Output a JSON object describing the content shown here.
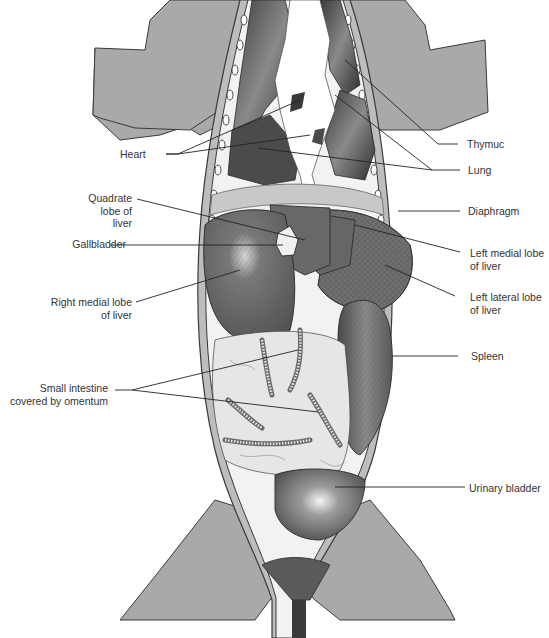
{
  "figure": {
    "colors": {
      "background": "#ffffff",
      "body_silhouette": "#a9a9a9",
      "outline": "#3a3a3a",
      "organ_dark": "#5a5a5a",
      "organ_mid": "#7d7d7d",
      "intestine_light": "#e6e6e6",
      "label_text": "#333333",
      "leader_line": "#222222"
    }
  },
  "labels": {
    "heart": "Heart",
    "thymus": "Thymuc",
    "lung": "Lung",
    "quadrate_lobe": [
      "Quadrate",
      "lobe of",
      "liver"
    ],
    "diaphragm": "Diaphragm",
    "gallbladder": "Gallbladder",
    "left_medial_lobe": [
      "Left medial lobe",
      "of liver"
    ],
    "left_lateral_lobe": [
      "Left lateral lobe",
      "of liver"
    ],
    "right_medial_lobe": [
      "Right medial lobe",
      "of liver"
    ],
    "spleen": "Spleen",
    "small_intestine": [
      "Small intestine",
      "covered by omentum"
    ],
    "urinary_bladder": "Urinary bladder"
  }
}
